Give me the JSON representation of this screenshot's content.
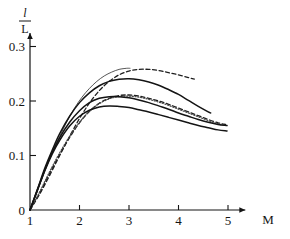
{
  "chart_data": {
    "type": "line",
    "title": "",
    "subtitle": "",
    "xlabel": "M",
    "ylabel_numerator": "l",
    "ylabel_denominator": "L",
    "ylabel": "l/L",
    "xlim": [
      1,
      5.35
    ],
    "ylim": [
      0,
      0.325
    ],
    "xticks": [
      1,
      2,
      3,
      4,
      5
    ],
    "xtick_labels": [
      "1",
      "2",
      "3",
      "4",
      "5"
    ],
    "yticks": [
      0,
      0.1,
      0.2,
      0.3
    ],
    "ytick_labels": [
      "0",
      "0.1",
      "0.2",
      "0.3"
    ],
    "grid": false,
    "legend": "none",
    "axis_color": "#141414",
    "series": [
      {
        "name": "curve-1-thin-solid-peak-top",
        "style": "solid",
        "width": 0.8,
        "color": "#2b2b2b",
        "x": [
          1.0,
          1.15,
          1.3,
          1.45,
          1.6,
          1.75,
          1.9,
          2.05,
          2.2,
          2.35,
          2.5,
          2.65,
          2.8,
          2.95,
          3.02
        ],
        "y": [
          0.0,
          0.035,
          0.072,
          0.105,
          0.135,
          0.163,
          0.187,
          0.207,
          0.223,
          0.236,
          0.246,
          0.253,
          0.258,
          0.26,
          0.26
        ]
      },
      {
        "name": "curve-2-dashed-upper",
        "style": "dashed",
        "width": 1.3,
        "color": "#1f1f1f",
        "x": [
          1.0,
          1.2,
          1.4,
          1.6,
          1.8,
          2.0,
          2.2,
          2.4,
          2.6,
          2.8,
          3.0,
          3.2,
          3.4,
          3.6,
          3.8,
          4.0,
          4.2,
          4.32
        ],
        "y": [
          0.0,
          0.03,
          0.064,
          0.1,
          0.135,
          0.168,
          0.196,
          0.219,
          0.236,
          0.248,
          0.255,
          0.258,
          0.258,
          0.256,
          0.252,
          0.248,
          0.243,
          0.24
        ]
      },
      {
        "name": "curve-3-solid-second",
        "style": "solid",
        "width": 1.5,
        "color": "#141414",
        "x": [
          1.0,
          1.15,
          1.3,
          1.45,
          1.6,
          1.8,
          2.0,
          2.2,
          2.4,
          2.6,
          2.8,
          3.0,
          3.2,
          3.4,
          3.6,
          3.8,
          4.0,
          4.2,
          4.4,
          4.6,
          4.65
        ],
        "y": [
          0.0,
          0.038,
          0.077,
          0.11,
          0.14,
          0.172,
          0.197,
          0.215,
          0.228,
          0.236,
          0.24,
          0.241,
          0.239,
          0.235,
          0.229,
          0.221,
          0.212,
          0.201,
          0.19,
          0.18,
          0.178
        ]
      },
      {
        "name": "curve-4-dashed-middle",
        "style": "dashed",
        "width": 1.3,
        "color": "#1f1f1f",
        "x": [
          1.0,
          1.2,
          1.4,
          1.6,
          1.8,
          2.0,
          2.2,
          2.4,
          2.6,
          2.8,
          3.0,
          3.2,
          3.4,
          3.6,
          3.8,
          4.0,
          4.2,
          4.4,
          4.6,
          4.8,
          4.95
        ],
        "y": [
          0.0,
          0.032,
          0.068,
          0.102,
          0.133,
          0.16,
          0.181,
          0.196,
          0.205,
          0.21,
          0.211,
          0.209,
          0.205,
          0.2,
          0.194,
          0.187,
          0.18,
          0.173,
          0.166,
          0.16,
          0.157
        ]
      },
      {
        "name": "curve-5-dotted",
        "style": "dotted",
        "width": 1.2,
        "color": "#4a4a4a",
        "x": [
          1.0,
          1.2,
          1.4,
          1.6,
          1.8,
          2.0,
          2.2,
          2.4,
          2.6,
          2.8,
          3.0,
          3.2,
          3.4,
          3.6,
          3.8,
          4.0,
          4.2,
          4.4,
          4.6,
          4.8,
          4.95
        ],
        "y": [
          0.0,
          0.034,
          0.071,
          0.105,
          0.135,
          0.161,
          0.181,
          0.195,
          0.204,
          0.208,
          0.209,
          0.207,
          0.203,
          0.198,
          0.192,
          0.185,
          0.178,
          0.171,
          0.164,
          0.158,
          0.155
        ]
      },
      {
        "name": "curve-6-solid-middle",
        "style": "solid",
        "width": 1.5,
        "color": "#141414",
        "x": [
          1.0,
          1.15,
          1.3,
          1.45,
          1.6,
          1.8,
          2.0,
          2.2,
          2.4,
          2.6,
          2.8,
          3.0,
          3.2,
          3.4,
          3.6,
          3.8,
          4.0,
          4.2,
          4.4,
          4.6,
          4.8,
          4.98
        ],
        "y": [
          0.0,
          0.037,
          0.074,
          0.106,
          0.133,
          0.161,
          0.182,
          0.197,
          0.205,
          0.208,
          0.208,
          0.206,
          0.202,
          0.197,
          0.191,
          0.185,
          0.178,
          0.172,
          0.166,
          0.161,
          0.157,
          0.155
        ]
      },
      {
        "name": "curve-7-solid-lowest",
        "style": "solid",
        "width": 1.5,
        "color": "#141414",
        "x": [
          1.0,
          1.15,
          1.3,
          1.45,
          1.6,
          1.8,
          2.0,
          2.2,
          2.4,
          2.6,
          2.8,
          3.0,
          3.2,
          3.4,
          3.6,
          3.8,
          4.0,
          4.2,
          4.4,
          4.6,
          4.8,
          4.98
        ],
        "y": [
          0.0,
          0.036,
          0.072,
          0.103,
          0.128,
          0.154,
          0.172,
          0.183,
          0.189,
          0.191,
          0.19,
          0.188,
          0.184,
          0.18,
          0.175,
          0.17,
          0.165,
          0.16,
          0.155,
          0.151,
          0.147,
          0.145
        ]
      }
    ]
  }
}
